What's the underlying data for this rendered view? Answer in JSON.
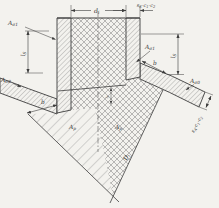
{
  "figure": {
    "colors": {
      "paper": "#f3f2ee",
      "line": "#3c3c3c",
      "hatch": "#777777"
    },
    "labels": {
      "di": {
        "base": "d",
        "sub": "i"
      },
      "ss": {
        "p1": "s",
        "s1": "S",
        "p2": "-c",
        "s2": "1",
        "p3": "-c",
        "s3": "2"
      },
      "sa": {
        "p1": "s",
        "s1": "A",
        "p2": "-c",
        "s2": "1",
        "p3": "-c",
        "s3": "2"
      },
      "ls_left": {
        "base": "l",
        "sub": "S"
      },
      "ls_right": {
        "base": "l",
        "sub": "S"
      },
      "ls_inner": {
        "base": "l",
        "sub": "S"
      },
      "b_left": "b",
      "b_right": "b",
      "a_sigma1_left": {
        "base": "A",
        "sub": "σ1"
      },
      "a_sigma1_right": {
        "base": "A",
        "sub": "σ1"
      },
      "a_sigma0_left": {
        "base": "A",
        "sub": "σ0"
      },
      "a_sigma0_right": {
        "base": "A",
        "sub": "σ0"
      },
      "ap_left": {
        "base": "A",
        "sub": "p"
      },
      "ap_right": {
        "base": "A",
        "sub": "p"
      },
      "Di": {
        "base": "D",
        "sub": "i"
      }
    }
  }
}
